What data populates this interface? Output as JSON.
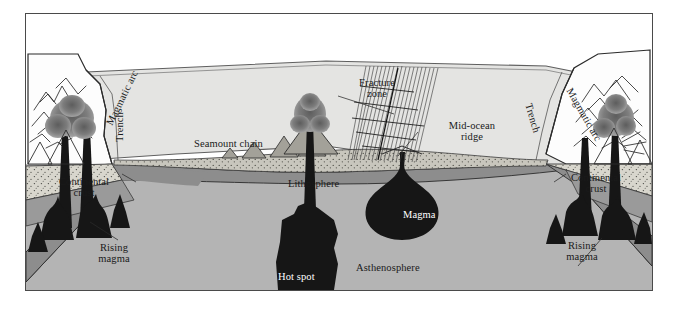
{
  "figure": {
    "type": "geological-cross-section",
    "frame": {
      "border_color": "#4a4a4a",
      "background": "#ffffff"
    }
  },
  "palette": {
    "ocean_water": "#e4e4e2",
    "ocean_surface_line": "#6d6d6d",
    "land_white": "#fdfdfd",
    "continental_crust": "#d8d6cd",
    "oceanic_crust": "#b9b7ae",
    "lithosphere": "#8d8d8d",
    "lithosphere_dark": "#7b7b7b",
    "asthenosphere": "#b4b4b4",
    "magma_black": "#161616",
    "plume_smoke": "#7e7e7e",
    "outline": "#2b2b2b"
  },
  "labels": {
    "magmatic_arc_left": "Magmatic arc",
    "trench_left": "Trench",
    "seamount_chain": "Seamount chain",
    "fracture_zone": "Fracture\nzone",
    "fracture_zone_line1": "Fracture",
    "fracture_zone_line2": "zone",
    "mid_ocean_ridge_line1": "Mid-ocean",
    "mid_ocean_ridge_line2": "ridge",
    "trench_right": "Trench",
    "magmatic_arc_right": "Magmatic arc",
    "continental_crust_left_line1": "Continental",
    "continental_crust_left_line2": "crust",
    "continental_crust_right_line1": "Continental",
    "continental_crust_right_line2": "crust",
    "lithosphere": "Lithosphere",
    "magma": "Magma",
    "asthenosphere": "Asthenosphere",
    "rising_magma_left_line1": "Rising",
    "rising_magma_left_line2": "magma",
    "rising_magma_right_line1": "Rising",
    "rising_magma_right_line2": "magma",
    "hot_spot": "Hot spot"
  },
  "features": [
    {
      "name": "magmatic-arc-left",
      "kind": "volcanic-arc",
      "side": "left"
    },
    {
      "name": "trench-left",
      "kind": "trench",
      "side": "left"
    },
    {
      "name": "seamount-chain",
      "kind": "seamount-chain",
      "count": 5
    },
    {
      "name": "fracture-zone",
      "kind": "fracture-zone"
    },
    {
      "name": "mid-ocean-ridge",
      "kind": "spreading-center"
    },
    {
      "name": "trench-right",
      "kind": "trench",
      "side": "right"
    },
    {
      "name": "magmatic-arc-right",
      "kind": "volcanic-arc",
      "side": "right"
    },
    {
      "name": "magma-chamber",
      "kind": "magma-body"
    },
    {
      "name": "hot-spot",
      "kind": "mantle-plume"
    },
    {
      "name": "rising-magma-left",
      "kind": "magma-conduit",
      "side": "left"
    },
    {
      "name": "rising-magma-right",
      "kind": "magma-conduit",
      "side": "right"
    }
  ]
}
